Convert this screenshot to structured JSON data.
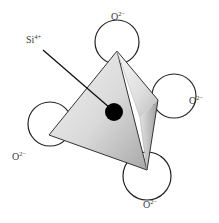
{
  "diagram": {
    "cation": {
      "label": "Si",
      "charge": "4+",
      "color": "#000000"
    },
    "anions": [
      {
        "position": "top",
        "label": "O",
        "charge": "2−"
      },
      {
        "position": "right",
        "label": "O",
        "charge": "2−"
      },
      {
        "position": "left",
        "label": "O",
        "charge": "2−"
      },
      {
        "position": "bottom",
        "label": "O",
        "charge": "2−"
      }
    ],
    "colors": {
      "background": "#ffffff",
      "outline": "#222222",
      "face_light": "#eeeeee",
      "face_mid": "#cfcfcf",
      "face_dark": "#a9a9a9",
      "text": "#3a3a3a"
    }
  }
}
